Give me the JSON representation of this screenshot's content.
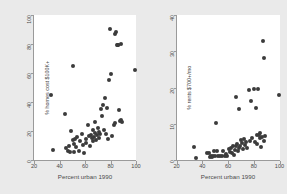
{
  "figure": {
    "background_color": "#eaeaea",
    "plot_background_color": "#ffffff",
    "marker_color": "#3b3b3b",
    "axis_color": "#9a9a9a"
  },
  "chart_data": [
    {
      "type": "scatter",
      "panel": "left",
      "title": "",
      "xlabel": "Percent urban 1990",
      "ylabel": "% homes cost $100K+",
      "xlim": [
        20,
        100
      ],
      "ylim": [
        0,
        100
      ],
      "xticks": [
        20,
        40,
        60,
        80,
        100
      ],
      "yticks": [
        0,
        20,
        40,
        60,
        80,
        100
      ],
      "xticklabels": [
        "20",
        "40",
        "60",
        "80",
        "100"
      ],
      "yticklabels": [
        "0",
        "20",
        "40",
        "60",
        "80",
        "100"
      ],
      "grid": false,
      "legend": "none",
      "points": [
        [
          33.2,
          44.5
        ],
        [
          34.8,
          7.2
        ],
        [
          44.6,
          31.8
        ],
        [
          45.3,
          8.6
        ],
        [
          46.5,
          6.1
        ],
        [
          47.2,
          9.4
        ],
        [
          48.1,
          5.8
        ],
        [
          49.0,
          20.0
        ],
        [
          50.2,
          64.5
        ],
        [
          50.6,
          13.5
        ],
        [
          51.0,
          11.2
        ],
        [
          51.5,
          5.4
        ],
        [
          52.4,
          14.8
        ],
        [
          53.2,
          9.0
        ],
        [
          54.0,
          16.2
        ],
        [
          55.3,
          6.0
        ],
        [
          56.0,
          13.0
        ],
        [
          57.5,
          18.1
        ],
        [
          58.2,
          10.5
        ],
        [
          59.0,
          5.1
        ],
        [
          60.4,
          14.3
        ],
        [
          61.1,
          12.0
        ],
        [
          62.3,
          24.0
        ],
        [
          63.0,
          16.8
        ],
        [
          63.8,
          9.8
        ],
        [
          64.5,
          17.5
        ],
        [
          65.2,
          15.0
        ],
        [
          65.9,
          21.0
        ],
        [
          66.4,
          13.2
        ],
        [
          67.0,
          16.0
        ],
        [
          67.6,
          26.5
        ],
        [
          68.2,
          18.5
        ],
        [
          68.8,
          14.0
        ],
        [
          69.4,
          17.0
        ],
        [
          70.0,
          21.8
        ],
        [
          70.6,
          15.5
        ],
        [
          71.2,
          19.0
        ],
        [
          72.0,
          17.8
        ],
        [
          72.8,
          35.5
        ],
        [
          73.5,
          30.2
        ],
        [
          74.2,
          38.0
        ],
        [
          74.8,
          20.5
        ],
        [
          75.5,
          42.8
        ],
        [
          76.2,
          18.0
        ],
        [
          77.0,
          36.0
        ],
        [
          78.0,
          14.8
        ],
        [
          78.8,
          55.0
        ],
        [
          79.5,
          90.5
        ],
        [
          80.2,
          59.0
        ],
        [
          81.0,
          16.5
        ],
        [
          82.5,
          24.0
        ],
        [
          83.2,
          87.0
        ],
        [
          83.8,
          25.5
        ],
        [
          84.5,
          88.5
        ],
        [
          85.0,
          79.5
        ],
        [
          85.6,
          79.2
        ],
        [
          86.2,
          79.0
        ],
        [
          86.8,
          34.5
        ],
        [
          87.4,
          26.8
        ],
        [
          88.0,
          27.5
        ],
        [
          88.6,
          79.8
        ],
        [
          89.2,
          26.0
        ],
        [
          99.5,
          62.0
        ]
      ]
    },
    {
      "type": "scatter",
      "panel": "right",
      "title": "",
      "xlabel": "Percent urban 1990",
      "ylabel": "% rents $700+/mo",
      "xlim": [
        20,
        100
      ],
      "ylim": [
        0,
        40
      ],
      "xticks": [
        20,
        40,
        60,
        80,
        100
      ],
      "yticks": [
        0,
        10,
        20,
        30,
        40
      ],
      "xticklabels": [
        "20",
        "40",
        "60",
        "80",
        "100"
      ],
      "yticklabels": [
        "0",
        "10",
        "20",
        "30",
        "40"
      ],
      "grid": false,
      "legend": "none",
      "points": [
        [
          33.4,
          3.6
        ],
        [
          35.0,
          0.5
        ],
        [
          44.0,
          1.9
        ],
        [
          45.2,
          2.0
        ],
        [
          46.0,
          0.9
        ],
        [
          46.8,
          1.0
        ],
        [
          47.5,
          0.9
        ],
        [
          48.2,
          1.0
        ],
        [
          49.0,
          2.6
        ],
        [
          50.0,
          1.1
        ],
        [
          50.8,
          10.2
        ],
        [
          51.6,
          2.5
        ],
        [
          52.5,
          1.0
        ],
        [
          53.4,
          1.2
        ],
        [
          55.0,
          1.1
        ],
        [
          56.5,
          2.4
        ],
        [
          57.5,
          1.0
        ],
        [
          58.5,
          1.6
        ],
        [
          59.5,
          1.2
        ],
        [
          60.5,
          3.0
        ],
        [
          61.2,
          2.2
        ],
        [
          62.0,
          3.4
        ],
        [
          63.0,
          2.0
        ],
        [
          63.8,
          4.0
        ],
        [
          64.5,
          1.4
        ],
        [
          65.2,
          2.8
        ],
        [
          65.9,
          3.9
        ],
        [
          66.5,
          17.5
        ],
        [
          67.2,
          4.4
        ],
        [
          67.8,
          2.6
        ],
        [
          68.4,
          3.3
        ],
        [
          68.9,
          14.0
        ],
        [
          69.5,
          4.0
        ],
        [
          70.2,
          5.4
        ],
        [
          71.0,
          4.7
        ],
        [
          71.8,
          3.1
        ],
        [
          72.5,
          5.8
        ],
        [
          73.2,
          4.2
        ],
        [
          74.0,
          5.0
        ],
        [
          75.0,
          3.4
        ],
        [
          76.0,
          19.4
        ],
        [
          77.0,
          5.2
        ],
        [
          78.0,
          16.3
        ],
        [
          79.0,
          6.2
        ],
        [
          80.0,
          19.6
        ],
        [
          80.8,
          5.0
        ],
        [
          81.5,
          14.4
        ],
        [
          82.2,
          6.8
        ],
        [
          82.8,
          4.3
        ],
        [
          83.4,
          19.5
        ],
        [
          84.0,
          7.0
        ],
        [
          84.6,
          6.0
        ],
        [
          85.2,
          7.4
        ],
        [
          85.8,
          3.6
        ],
        [
          86.4,
          6.4
        ],
        [
          87.0,
          32.8
        ],
        [
          87.6,
          5.2
        ],
        [
          88.2,
          28.2
        ],
        [
          89.0,
          6.6
        ],
        [
          99.5,
          18.0
        ]
      ]
    }
  ]
}
